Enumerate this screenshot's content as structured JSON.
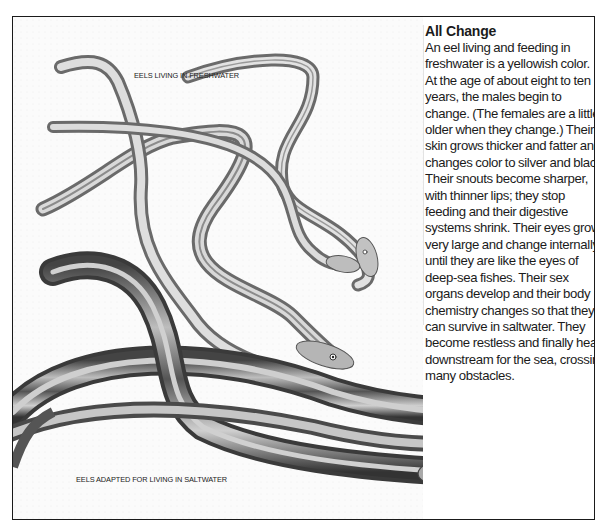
{
  "article": {
    "title": "All Change",
    "body_lines": [
      "An eel living and feeding in",
      "freshwater is a yellowish color.",
      "At the age of about eight to ten",
      "years, the males begin to",
      "change. (The females are a little",
      "older when they change.) Their",
      "skin grows thicker and fatter and",
      "changes color to silver and black.",
      "Their snouts become sharper,",
      "with thinner lips; they stop",
      "feeding and their digestive",
      "systems shrink. Their eyes grow",
      "very large and change internally",
      "until they are like the eyes of",
      "deep-sea fishes. Their sex",
      "organs develop and their body",
      "chemistry changes so that they",
      "can survive in saltwater. They",
      "become restless and finally head",
      "downstream for the sea, crossing",
      "many obstacles."
    ]
  },
  "illustration": {
    "label_freshwater": "EELS LIVING IN FRESHWATER",
    "label_saltwater": "EELS ADAPTED FOR LIVING IN SALTWATER",
    "colors": {
      "frame": "#1a1a1a",
      "eel_light": "#d8d8d8",
      "eel_mid": "#9a9a9a",
      "eel_dark": "#3c3c3c",
      "paper": "#fbfbfb"
    }
  }
}
